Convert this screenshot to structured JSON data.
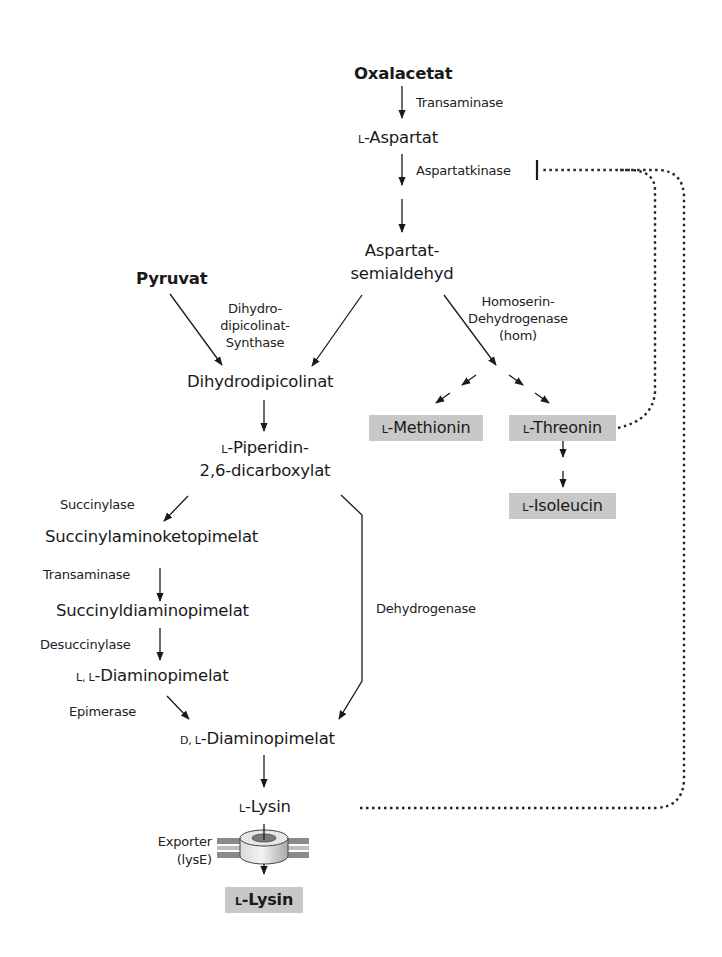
{
  "colors": {
    "text": "#1a1a1a",
    "product_box": "#c8c8c8",
    "arrow": "#1a1a1a",
    "feedback_dotted": "#222222",
    "membrane": "#8a8a8a"
  },
  "metabolites": {
    "oxalacetat": "Oxalacetat",
    "aspartat_prefix": "L",
    "aspartat": "-Aspartat",
    "aspartatsemialdehyd_line1": "Aspartat-",
    "aspartatsemialdehyd_line2": "semialdehyd",
    "pyruvat": "Pyruvat",
    "dihydrodipicolinat": "Dihydrodipicolinat",
    "piperidin_prefix": "L",
    "piperidin_line1": "-Piperidin-",
    "piperidin_line2": "2,6-dicarboxylat",
    "succinylaminoketopimelat": "Succinylaminoketopimelat",
    "succinyldiaminopimelat": "Succinyldiaminopimelat",
    "ll_dap_prefix": "L, L",
    "ll_dap": "-Diaminopimelat",
    "dl_dap_prefix": "D, L",
    "dl_dap": "-Diaminopimelat",
    "lysin_prefix": "L",
    "lysin": "-Lysin"
  },
  "products": {
    "methionin_prefix": "L",
    "methionin": "-Methionin",
    "threonin_prefix": "L",
    "threonin": "-Threonin",
    "isoleucin_prefix": "L",
    "isoleucin": "-Isoleucin",
    "lysin_export_prefix": "L",
    "lysin_export": "-Lysin"
  },
  "enzymes": {
    "transaminase_1": "Transaminase",
    "aspartatkinase": "Aspartatkinase",
    "dhdps_line1": "Dihydro-",
    "dhdps_line2": "dipicolinat-",
    "dhdps_line3": "Synthase",
    "hom_line1": "Homoserin-",
    "hom_line2": "Dehydrogenase",
    "hom_line3": "(hom)",
    "succinylase": "Succinylase",
    "transaminase_2": "Transaminase",
    "desuccinylase": "Desuccinylase",
    "epimerase": "Epimerase",
    "dehydrogenase": "Dehydrogenase",
    "exporter_line1": "Exporter",
    "exporter_line2": "(lysE)"
  }
}
